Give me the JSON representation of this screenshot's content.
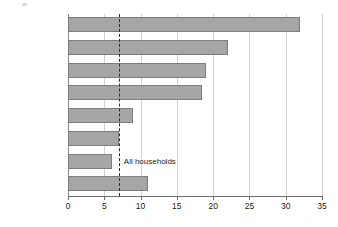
{
  "chart_data": {
    "type": "bar",
    "orientation": "horizontal",
    "title": "",
    "subtitle": "",
    "xlabel": "",
    "ylabel": "",
    "xlim": [
      0,
      35
    ],
    "xticks": [
      0,
      5,
      10,
      15,
      20,
      25,
      30,
      35
    ],
    "xtick_labels": [
      "0",
      "5",
      "10",
      "15",
      "20",
      "25",
      "30",
      "35"
    ],
    "grid": "vertical",
    "legend": "none",
    "categories": [
      "Muslim",
      "Hindu",
      "Sikh",
      "Buddhist",
      "No Religion",
      "Jewish",
      "Christian",
      "Other religions"
    ],
    "values": [
      32,
      22,
      19,
      18.5,
      9,
      7,
      6,
      11
    ],
    "annotations": [
      {
        "type": "reference-line",
        "label": "All households",
        "value": 7,
        "style": "dashed"
      }
    ],
    "colors": {
      "bar_fill": "#a6a6a6",
      "bar_border": "#7d7d7d",
      "gridline": "#d2d2d2",
      "axis": "#6e6e6e",
      "reference_line": "#2b2b2b",
      "text": "#1a1a1a",
      "background": "#ffffff"
    }
  }
}
